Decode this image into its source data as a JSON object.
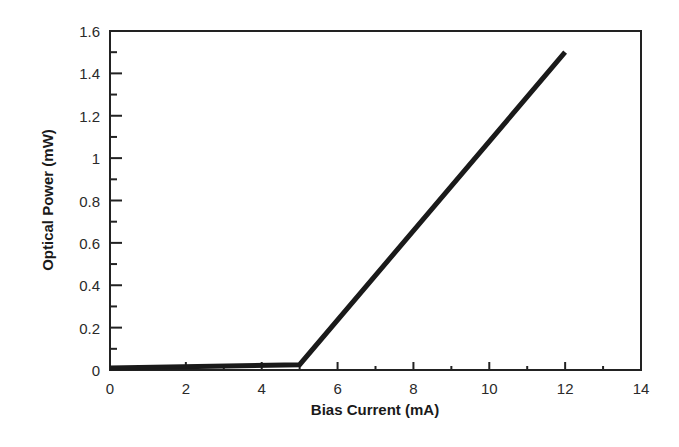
{
  "chart_data": {
    "type": "line",
    "title": "",
    "xlabel": "Bias Current (mA)",
    "ylabel": "Optical Power (mW)",
    "xlim": [
      0,
      14
    ],
    "ylim": [
      0,
      1.6
    ],
    "grid": false,
    "legend": null,
    "x_ticks": [
      0,
      2,
      4,
      6,
      8,
      10,
      12,
      14
    ],
    "x_tick_labels": [
      "0",
      "2",
      "4",
      "6",
      "8",
      "10",
      "12",
      "14"
    ],
    "x_minor_ticks": [
      1,
      3,
      5,
      7,
      9,
      11,
      13
    ],
    "y_ticks": [
      0,
      0.2,
      0.4,
      0.6,
      0.8,
      1,
      1.2,
      1.4,
      1.6
    ],
    "y_tick_labels": [
      "0",
      "0.2",
      "0.4",
      "0.6",
      "0.8",
      "1",
      "1.2",
      "1.4",
      "1.6"
    ],
    "y_minor_ticks": [
      0.1,
      0.3,
      0.5,
      0.7,
      0.9,
      1.1,
      1.3,
      1.5
    ],
    "series": [
      {
        "name": "Laser L-I curve",
        "color": "#1a1a1a",
        "x": [
          0,
          5,
          12
        ],
        "y": [
          0.01,
          0.025,
          1.5
        ]
      }
    ],
    "annotations": []
  },
  "colors": {
    "axis": "#222222",
    "line": "#1a1a1a",
    "background": "#ffffff"
  }
}
